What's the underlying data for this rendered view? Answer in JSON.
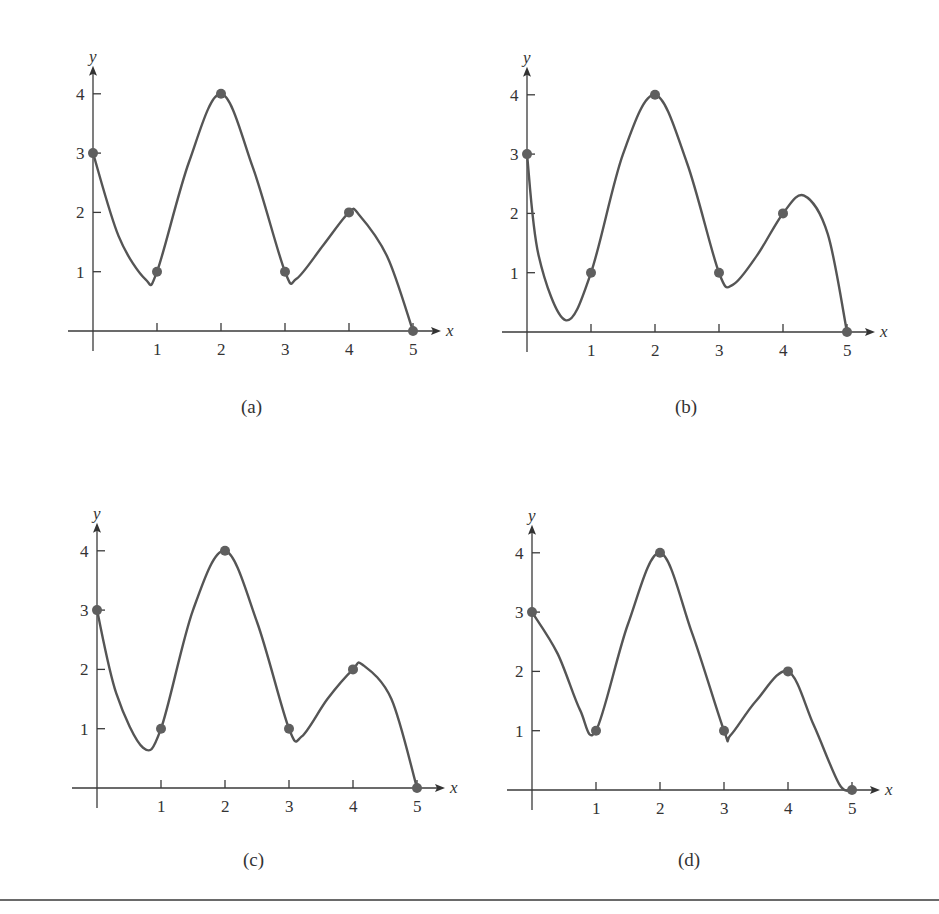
{
  "figure": {
    "panels": [
      {
        "id": "a",
        "caption": "(a)",
        "origin": [
          93,
          331
        ],
        "caption_pos": [
          253,
          412
        ]
      },
      {
        "id": "b",
        "caption": "(b)",
        "origin": [
          527,
          332
        ],
        "caption_pos": [
          687,
          412
        ]
      },
      {
        "id": "c",
        "caption": "(c)",
        "origin": [
          97,
          788
        ],
        "caption_pos": [
          255,
          865
        ]
      },
      {
        "id": "d",
        "caption": "(d)",
        "origin": [
          532,
          790
        ],
        "caption_pos": [
          690,
          865
        ]
      }
    ],
    "x_unit_px": 64,
    "y_unit_px": 59.3
  },
  "chart_data": [
    {
      "type": "line",
      "title": "(a)",
      "xlabel": "x",
      "ylabel": "y",
      "x_ticks": [
        1,
        2,
        3,
        4,
        5
      ],
      "y_ticks": [
        1,
        2,
        3,
        4
      ],
      "xlim": [
        0,
        5
      ],
      "ylim": [
        0,
        4
      ],
      "grid": false,
      "marked_points": {
        "x": [
          0,
          1,
          2,
          3,
          4,
          5
        ],
        "y": [
          3,
          1,
          4,
          1,
          2,
          0
        ]
      },
      "curve": {
        "x": [
          0,
          0.4,
          0.82,
          1,
          1.5,
          2,
          2.5,
          3,
          3.18,
          3.6,
          4,
          4.15,
          4.6,
          5
        ],
        "y": [
          3,
          1.6,
          0.87,
          1,
          2.85,
          4,
          2.75,
          1,
          0.88,
          1.45,
          2,
          1.97,
          1.25,
          0
        ]
      }
    },
    {
      "type": "line",
      "title": "(b)",
      "xlabel": "x",
      "ylabel": "y",
      "x_ticks": [
        1,
        2,
        3,
        4,
        5
      ],
      "y_ticks": [
        1,
        2,
        3,
        4
      ],
      "xlim": [
        0,
        5
      ],
      "ylim": [
        0,
        4
      ],
      "grid": false,
      "marked_points": {
        "x": [
          0,
          1,
          2,
          3,
          4,
          5
        ],
        "y": [
          3,
          1,
          4,
          1,
          2,
          0
        ]
      },
      "curve": {
        "x": [
          0,
          0.18,
          0.6,
          1,
          1.5,
          2,
          2.5,
          3,
          3.22,
          3.6,
          4,
          4.33,
          4.7,
          5
        ],
        "y": [
          3,
          1.3,
          0.2,
          1,
          3,
          4,
          2.85,
          1,
          0.8,
          1.3,
          2,
          2.3,
          1.65,
          0
        ]
      }
    },
    {
      "type": "line",
      "title": "(c)",
      "xlabel": "x",
      "ylabel": "y",
      "x_ticks": [
        1,
        2,
        3,
        4,
        5
      ],
      "y_ticks": [
        1,
        2,
        3,
        4
      ],
      "xlim": [
        0,
        5
      ],
      "ylim": [
        0,
        4
      ],
      "grid": false,
      "marked_points": {
        "x": [
          0,
          1,
          2,
          3,
          4,
          5
        ],
        "y": [
          3,
          1,
          4,
          1,
          2,
          0
        ]
      },
      "curve": {
        "x": [
          0,
          0.3,
          0.72,
          1,
          1.5,
          2,
          2.5,
          3,
          3.2,
          3.6,
          4,
          4.15,
          4.6,
          5
        ],
        "y": [
          3,
          1.6,
          0.68,
          1,
          3,
          4,
          2.8,
          1,
          0.87,
          1.5,
          2,
          2.08,
          1.5,
          0
        ]
      }
    },
    {
      "type": "line",
      "title": "(d)",
      "xlabel": "x",
      "ylabel": "y",
      "x_ticks": [
        1,
        2,
        3,
        4,
        5
      ],
      "y_ticks": [
        1,
        2,
        3,
        4
      ],
      "xlim": [
        0,
        5
      ],
      "ylim": [
        0,
        4
      ],
      "grid": false,
      "marked_points": {
        "x": [
          0,
          1,
          2,
          3,
          4,
          5
        ],
        "y": [
          3,
          1,
          4,
          1,
          2,
          0
        ]
      },
      "curve": {
        "x": [
          0,
          0.4,
          0.75,
          1,
          1.5,
          2,
          2.5,
          3,
          3.1,
          3.5,
          4,
          4.4,
          4.8,
          5
        ],
        "y": [
          3,
          2.3,
          1.35,
          1,
          2.8,
          4,
          2.65,
          1,
          0.92,
          1.5,
          2,
          1.1,
          0.1,
          0
        ]
      }
    }
  ]
}
